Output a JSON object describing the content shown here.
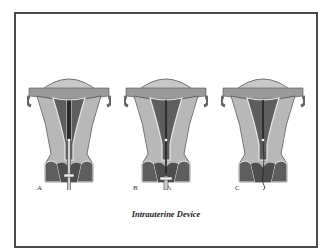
{
  "figure": {
    "title": "Intrauterine Device",
    "panels": [
      {
        "label": "A",
        "stage": "inserter-tube-in-uterus"
      },
      {
        "label": "B",
        "stage": "device-released-tube-withdrawing"
      },
      {
        "label": "C",
        "stage": "device-in-place-string-trailing"
      }
    ]
  },
  "colors": {
    "frame": "#4a4a4a",
    "tissue_light": "#b8b8b8",
    "tissue_dark": "#5e5e5e",
    "lining": "#e6e6e6",
    "device": "#222222"
  }
}
